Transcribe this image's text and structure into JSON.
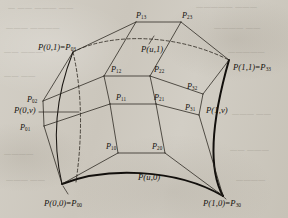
{
  "figure": {
    "type": "bezier-surface-patch-diagram",
    "background_color": "#cfcbc2",
    "ink_color": "#15120e"
  },
  "labels": {
    "corner_00": {
      "fn": "P(0,0)",
      "eq": "=",
      "ctrl": "P",
      "sub": "00"
    },
    "corner_10": {
      "fn": "P(1,0)",
      "eq": "=",
      "ctrl": "P",
      "sub": "30"
    },
    "corner_01": {
      "fn": "P(0,1)",
      "eq": "=",
      "ctrl": "P",
      "sub": "03"
    },
    "corner_11": {
      "fn": "P(1,1)",
      "eq": "=",
      "ctrl": "P",
      "sub": "33"
    },
    "curve_u0": "P(u,0)",
    "curve_u1": "P(u,1)",
    "curve_0v": "P(0,v)",
    "curve_1v": "P(1,v)"
  },
  "control_points": [
    {
      "name": "P01",
      "letter": "P",
      "sub": "01",
      "x": 20,
      "y": 124
    },
    {
      "name": "P02",
      "letter": "P",
      "sub": "02",
      "x": 27,
      "y": 96
    },
    {
      "name": "P10",
      "letter": "P",
      "sub": "10",
      "x": 106,
      "y": 143
    },
    {
      "name": "P11",
      "letter": "P",
      "sub": "11",
      "x": 116,
      "y": 94
    },
    {
      "name": "P12",
      "letter": "P",
      "sub": "12",
      "x": 111,
      "y": 66
    },
    {
      "name": "P13",
      "letter": "P",
      "sub": "13",
      "x": 136,
      "y": 12
    },
    {
      "name": "P20",
      "letter": "P",
      "sub": "20",
      "x": 152,
      "y": 143
    },
    {
      "name": "P21",
      "letter": "P",
      "sub": "21",
      "x": 154,
      "y": 94
    },
    {
      "name": "P22",
      "letter": "P",
      "sub": "22",
      "x": 154,
      "y": 66
    },
    {
      "name": "P23",
      "letter": "P",
      "sub": "23",
      "x": 182,
      "y": 12
    },
    {
      "name": "P31",
      "letter": "P",
      "sub": "31",
      "x": 185,
      "y": 104
    },
    {
      "name": "P32",
      "letter": "P",
      "sub": "32",
      "x": 187,
      "y": 83
    }
  ],
  "ghost_text": [
    {
      "t": "—  ——  ———   ——",
      "x": 8,
      "y": 4,
      "size": 7
    },
    {
      "t": "—————   ———",
      "x": 196,
      "y": 3,
      "size": 7
    },
    {
      "t": "———  ————",
      "x": 6,
      "y": 24,
      "size": 7
    },
    {
      "t": "————  ——",
      "x": 214,
      "y": 24,
      "size": 7
    },
    {
      "t": "——  ———",
      "x": 4,
      "y": 48,
      "size": 7
    },
    {
      "t": "—————",
      "x": 228,
      "y": 48,
      "size": 7
    },
    {
      "t": "——  ——",
      "x": 4,
      "y": 72,
      "size": 7
    },
    {
      "t": "———  ——",
      "x": 232,
      "y": 110,
      "size": 7
    },
    {
      "t": "————",
      "x": 4,
      "y": 150,
      "size": 7
    },
    {
      "t": "——  ———",
      "x": 230,
      "y": 146,
      "size": 7
    },
    {
      "t": "———  ——",
      "x": 6,
      "y": 176,
      "size": 7
    },
    {
      "t": "————",
      "x": 236,
      "y": 176,
      "size": 7
    }
  ]
}
